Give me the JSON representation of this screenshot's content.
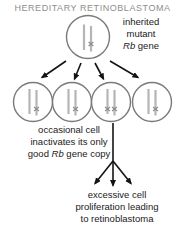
{
  "title": "HEREDITARY RETINOBLASTOMA",
  "annotations": {
    "inherited_mutant": {
      "line1": "inherited",
      "line2": "mutant",
      "rb": "Rb",
      "gene": " gene"
    },
    "occasional_cell": {
      "line1": "occasional cell",
      "line2": "inactivates its only",
      "line3_pre": "good ",
      "rb": "Rb",
      "line3_post": " gene copy"
    },
    "excessive": {
      "line1": "excessive cell",
      "line2": "proliferation leading",
      "line3": "to retinoblastoma"
    }
  },
  "diagram": {
    "parent_cell": {
      "chromosome_copies": 2,
      "mutated_copies": 1
    },
    "daughter_cells": [
      {
        "mutated_copies": 1
      },
      {
        "mutated_copies": 1
      },
      {
        "mutated_copies": 2
      },
      {
        "mutated_copies": 1
      }
    ]
  },
  "colors": {
    "background": "#ffffff",
    "title_gray": "#8e8e8e",
    "cell_outline": "#7a7a7a",
    "chromosome_gray": "#b5b5b5",
    "mutation_mark_gray": "#8d8d8d",
    "arrow_black": "#141414",
    "text_black": "#1a1a1a"
  }
}
